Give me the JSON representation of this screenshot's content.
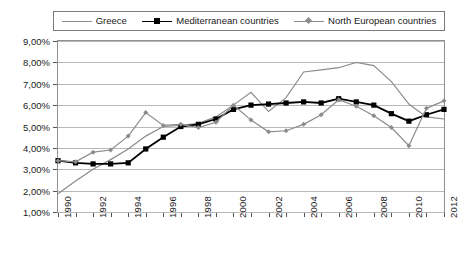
{
  "chart_data": {
    "type": "line",
    "title": "",
    "xlabel": "",
    "ylabel": "",
    "grid": true,
    "legend_position": "top",
    "x": [
      1990,
      1991,
      1992,
      1993,
      1994,
      1995,
      1996,
      1997,
      1998,
      1999,
      2000,
      2001,
      2002,
      2003,
      2004,
      2005,
      2006,
      2007,
      2008,
      2009,
      2010,
      2011,
      2012
    ],
    "tick_labels_x": [
      "1990",
      "1992",
      "1994",
      "1996",
      "1998",
      "2000",
      "2002",
      "2004",
      "2006",
      "2008",
      "2010",
      "2012"
    ],
    "tick_labels_y": [
      "1,00%",
      "2,00%",
      "3,00%",
      "4,00%",
      "5,00%",
      "6,00%",
      "7,00%",
      "8,00%",
      "9,00%"
    ],
    "ylim": [
      1.0,
      9.0
    ],
    "xlim": [
      1990,
      2012
    ],
    "y_tick_values": [
      1,
      2,
      3,
      4,
      5,
      6,
      7,
      8,
      9
    ],
    "series": [
      {
        "name": "Greece",
        "color": "#8c8c8c",
        "marker": "none",
        "values": [
          1.85,
          2.45,
          3.0,
          3.45,
          3.95,
          4.55,
          5.0,
          5.05,
          5.15,
          5.45,
          6.0,
          6.6,
          5.7,
          6.35,
          7.55,
          7.65,
          7.75,
          8.0,
          7.85,
          7.1,
          6.05,
          5.45,
          5.35
        ]
      },
      {
        "name": "Mediterranean countries",
        "color": "#000000",
        "marker": "square",
        "values": [
          3.4,
          3.3,
          3.25,
          3.25,
          3.3,
          3.95,
          4.5,
          5.0,
          5.1,
          5.35,
          5.8,
          6.0,
          6.05,
          6.1,
          6.15,
          6.1,
          6.3,
          6.15,
          6.0,
          5.6,
          5.25,
          5.55,
          5.8
        ]
      },
      {
        "name": "North European countries",
        "color": "#8c8c8c",
        "marker": "diamond",
        "values": [
          3.4,
          3.35,
          3.8,
          3.9,
          4.55,
          5.65,
          5.05,
          5.1,
          4.95,
          5.2,
          6.0,
          5.3,
          4.75,
          4.8,
          5.1,
          5.55,
          6.25,
          5.95,
          5.5,
          4.95,
          4.1,
          5.85,
          6.2
        ]
      }
    ]
  },
  "legend": {
    "items": [
      {
        "label": "Greece"
      },
      {
        "label": "Mediterranean countries"
      },
      {
        "label": "North European countries"
      }
    ]
  },
  "caption": {
    "text": ""
  }
}
